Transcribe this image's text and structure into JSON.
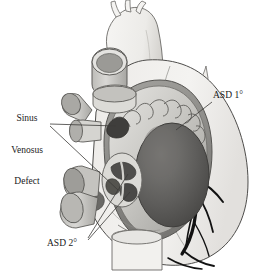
{
  "figure": {
    "background_color": "#ffffff",
    "ink_color": "#1a1a1a"
  },
  "labels": [
    {
      "id": "sinus-venosus-defect",
      "lines": [
        "Sinus",
        "Venosus",
        "Defect"
      ],
      "text": "Sinus Venosus Defect",
      "position": "left"
    },
    {
      "id": "asd-primum",
      "text": "ASD 1°",
      "position": "upper-right"
    },
    {
      "id": "asd-secundum",
      "text": "ASD 2°",
      "position": "bottom-left"
    }
  ],
  "anatomy": {
    "aorta": "aortic-arch-with-three-branches",
    "svc_stump": "superior-vena-cava-cut-end",
    "pulmonary_veins": "pulmonary-vein-stumps",
    "ivc_stump": "inferior-vena-cava-cut-end",
    "right_atrium": "opened-right-atrium",
    "pectinate_muscles": "pectinate-muscle-ridges",
    "tricuspid_orifice": "tricuspid-valve-orifice",
    "fossa_ovalis": "fossa-ovalis-with-secundum-defects",
    "coronary_arteries": "right-coronary-artery-branches",
    "right_ventricle": "right-ventricle-free-wall"
  },
  "palette": {
    "outline": "#5a5a5a",
    "dark_outline": "#111111",
    "pale_fill": "#f4f4f3",
    "light_gray": "#d8d7d4",
    "mid_gray": "#b6b5b1",
    "atrium_gray": "#c9c8c4",
    "deep_gray": "#8e8d8a",
    "shadow_gray": "#6f6e6b",
    "orifice_gray": "#5c5b59",
    "leader_line": "#4a4a4a"
  }
}
